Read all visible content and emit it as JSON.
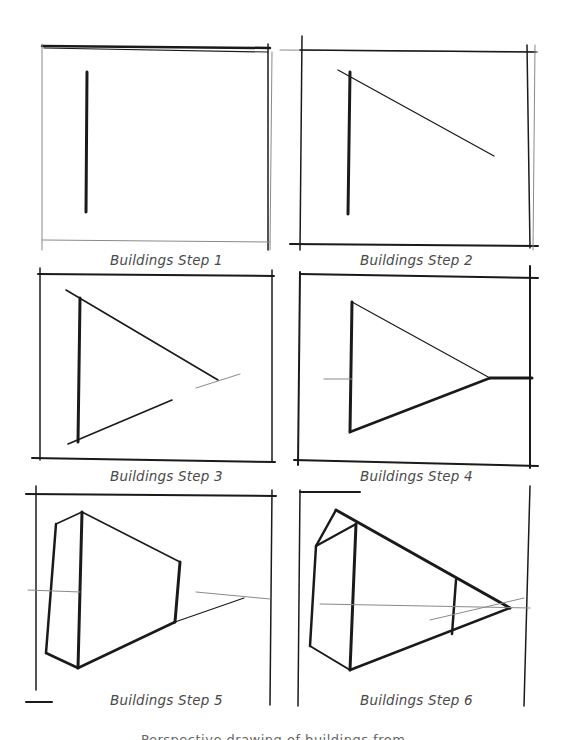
{
  "figure": {
    "panels": [
      {
        "id": 1,
        "caption": "Buildings Step 1"
      },
      {
        "id": 2,
        "caption": "Buildings Step 2"
      },
      {
        "id": 3,
        "caption": "Buildings Step 3"
      },
      {
        "id": 4,
        "caption": "Buildings Step 4"
      },
      {
        "id": 5,
        "caption": "Buildings Step 5"
      },
      {
        "id": 6,
        "caption": "Buildings Step 6"
      }
    ],
    "footer_caption": "Perspective drawing of buildings from ..."
  },
  "colors": {
    "background": "#ffffff",
    "ink": "#1a1a1a",
    "caption_text": "#4a4a4a"
  }
}
